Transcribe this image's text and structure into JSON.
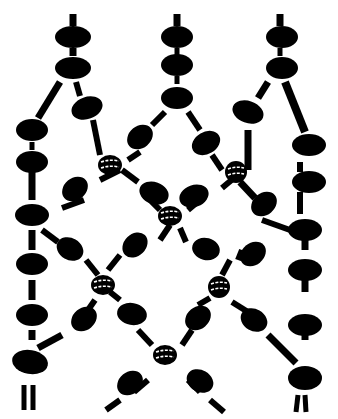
{
  "illustration": {
    "subject": "knotted bead net pattern",
    "colors": {
      "ink": "#000000",
      "paper": "#ffffff"
    },
    "columns": [
      "left-strand",
      "center-strand",
      "right-strand"
    ],
    "crossings": 5
  }
}
